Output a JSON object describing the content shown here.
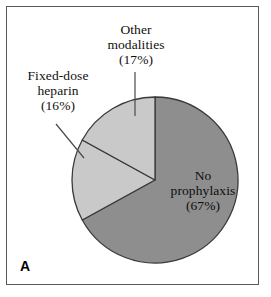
{
  "figure": {
    "panel_letter": "A"
  },
  "chart_data": {
    "type": "pie",
    "title": "",
    "categories": [
      "No prophylaxis",
      "Fixed-dose heparin",
      "Other modalities"
    ],
    "values": [
      67,
      16,
      17
    ],
    "value_unit": "%",
    "labels": [
      {
        "name": "No prophylaxis",
        "line1": "No",
        "line2": "prophylaxis",
        "percent_text": "(67%)",
        "value": 67,
        "color": "#8e8e8e",
        "placement": "inside",
        "leader_line": false
      },
      {
        "name": "Fixed-dose heparin",
        "line1": "Fixed-dose",
        "line2": "heparin",
        "percent_text": "(16%)",
        "value": 16,
        "color": "#c9c9c9",
        "placement": "outside-left",
        "leader_line": true
      },
      {
        "name": "Other modalities",
        "line1": "Other",
        "line2": "modalities",
        "percent_text": "(17%)",
        "value": 17,
        "color": "#c9c9c9",
        "placement": "outside-top",
        "leader_line": true
      }
    ],
    "legend": "none",
    "start_angle_deg": 0,
    "direction": "clockwise",
    "colors": {
      "no_prophylaxis": "#8e8e8e",
      "fixed_dose_heparin": "#c9c9c9",
      "other_modalities": "#c9c9c9",
      "slice_outline": "#3a3a3a",
      "panel_border": "#5a5a5a",
      "background": "#ffffff",
      "text": "#101010"
    },
    "geometry": {
      "center_x": 155,
      "center_y": 180,
      "radius": 83
    }
  }
}
